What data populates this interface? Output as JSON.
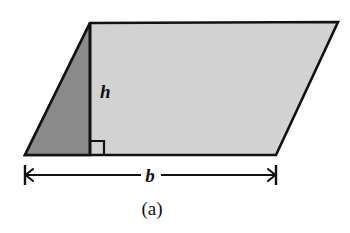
{
  "figure": {
    "caption": "(a)",
    "labels": {
      "height": "h",
      "base": "b"
    },
    "colors": {
      "outline": "#121212",
      "light_fill": "#d2d2d2",
      "dark_fill": "#8a8a8a",
      "background": "#ffffff",
      "text": "#101010"
    },
    "shape": {
      "type": "parallelogram",
      "vertices": [
        {
          "name": "bottom-left",
          "x": 25,
          "y": 155
        },
        {
          "name": "top-left",
          "x": 90,
          "y": 23
        },
        {
          "name": "top-right",
          "x": 338,
          "y": 22
        },
        {
          "name": "bottom-right",
          "x": 276,
          "y": 155
        }
      ]
    },
    "height_segment": {
      "x": 90,
      "y_top": 23,
      "y_bottom": 155
    },
    "right_angle_marker": {
      "x": 90,
      "y": 141,
      "size": 14
    },
    "dark_triangle": [
      {
        "x": 25,
        "y": 155
      },
      {
        "x": 90,
        "y": 23
      },
      {
        "x": 90,
        "y": 155
      }
    ],
    "base_dimension": {
      "y": 175,
      "x_start": 25,
      "x_end": 276,
      "tick_half_height": 10,
      "arrow_size": 7
    },
    "label_positions": {
      "height": {
        "x": 100,
        "y": 98
      },
      "base": {
        "x": 150,
        "y": 182
      },
      "caption": {
        "x": 152,
        "y": 215
      }
    },
    "font_sizes": {
      "height": 19,
      "base": 19,
      "caption": 19
    }
  }
}
